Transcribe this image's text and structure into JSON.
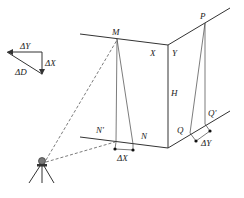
{
  "diagram": {
    "type": "survey-geometry",
    "labels": {
      "M": "M",
      "X": "X",
      "Y": "Y",
      "P": "P",
      "H": "H",
      "N_prime": "N'",
      "N": "N",
      "Q": "Q",
      "Q_prime": "Q'",
      "delta_X_bottom": "ΔX",
      "delta_Y_bottom": "ΔY"
    },
    "legend_triangle": {
      "delta_Y": "ΔY",
      "delta_X": "ΔX",
      "delta_D": "ΔD"
    },
    "instrument": "total-station-on-tripod",
    "colors": {
      "line": "#333333",
      "text": "#222222",
      "background": "#ffffff"
    }
  }
}
